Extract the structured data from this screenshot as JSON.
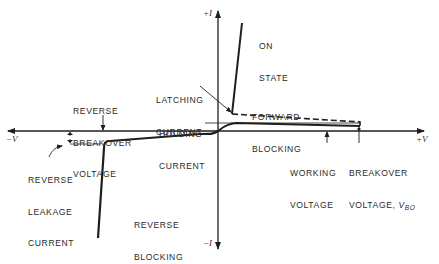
{
  "diagram": {
    "axes": {
      "y_positive": "+I",
      "y_negative": "−I",
      "x_positive": "+V",
      "x_negative": "−V"
    },
    "labels": {
      "on_state_1": "ON",
      "on_state_2": "STATE",
      "latching_current_1": "LATCHING",
      "latching_current_2": "CURRENT",
      "forward_blocking_1": "FORWARD",
      "forward_blocking_2": "BLOCKING",
      "reverse_breakover_1": "REVERSE",
      "reverse_breakover_2": "BREAKOVER",
      "reverse_breakover_3": "VOLTAGE",
      "holding_current_1": "HOLDING",
      "holding_current_2": "CURRENT",
      "reverse_leakage_1": "REVERSE",
      "reverse_leakage_2": "LEAKAGE",
      "reverse_leakage_3": "CURRENT",
      "working_voltage_1": "WORKING",
      "working_voltage_2": "VOLTAGE",
      "breakover_voltage_1": "BREAKOVER",
      "breakover_voltage_2": "VOLTAGE, ",
      "breakover_symbol": "V",
      "breakover_subscript": "BO",
      "reverse_blocking_1": "REVERSE",
      "reverse_blocking_2": "BLOCKING"
    },
    "colors": {
      "line": "#1e1e1e",
      "text": "#2a2a2a",
      "background": "#ffffff"
    }
  }
}
